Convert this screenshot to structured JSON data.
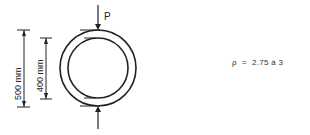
{
  "diagram": {
    "load_label": "P",
    "outer_dimension": "500 mm",
    "inner_dimension": "400 mm",
    "formula": {
      "symbol": "ρ",
      "equals": "=",
      "expression": "2.75 à 3"
    },
    "colors": {
      "line": "#222222",
      "text": "#333333"
    }
  }
}
